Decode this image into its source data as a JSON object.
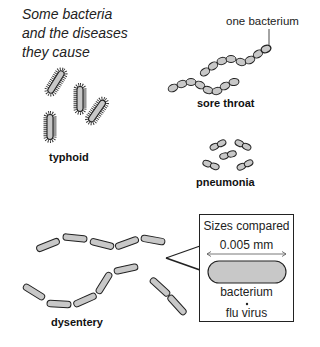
{
  "title": "Some bacteria and the diseases they cause",
  "title_lines": [
    "Some bacteria",
    "and the diseases",
    "they cause"
  ],
  "annotations": {
    "one_bacterium": "one bacterium"
  },
  "diseases": [
    {
      "name": "typhoid",
      "shape": "rod with flagella",
      "count": 4
    },
    {
      "name": "sore throat",
      "shape": "chain of cocci",
      "chains": 2
    },
    {
      "name": "pneumonia",
      "shape": "diplococci pairs",
      "count": 5
    },
    {
      "name": "dysentery",
      "shape": "chains of rods",
      "chains": 3
    }
  ],
  "inset": {
    "title": "Sizes compared",
    "scale": "0.005 mm",
    "bacterium_label": "bacterium",
    "virus_label": "flu virus"
  },
  "colors": {
    "cell_fill": "#c8c8c8",
    "outline": "#222222",
    "background": "#ffffff"
  }
}
